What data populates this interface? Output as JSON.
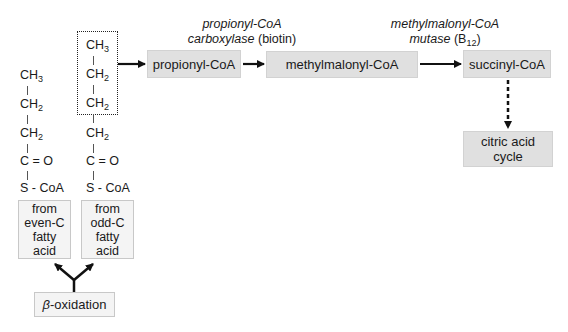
{
  "diagram": {
    "even_chain": {
      "atoms": [
        {
          "base": "CH",
          "sub": "3"
        },
        {
          "base": "CH",
          "sub": "2"
        },
        {
          "base": "CH",
          "sub": "2"
        },
        {
          "base": "C = O",
          "sub": ""
        },
        {
          "base": "S - CoA",
          "sub": ""
        }
      ],
      "source_label": [
        "from",
        "even-C",
        "fatty",
        "acid"
      ]
    },
    "odd_chain": {
      "atoms": [
        {
          "base": "CH",
          "sub": "3"
        },
        {
          "base": "CH",
          "sub": "2"
        },
        {
          "base": "CH",
          "sub": "2"
        },
        {
          "base": "CH",
          "sub": "2"
        },
        {
          "base": "C = O",
          "sub": ""
        },
        {
          "base": "S - CoA",
          "sub": ""
        }
      ],
      "source_label": [
        "from",
        "odd-C",
        "fatty",
        "acid"
      ]
    },
    "origin": {
      "greek": "β",
      "rest": "-oxidation"
    },
    "nodes": {
      "propionyl": "propionyl-CoA",
      "methylmalonyl": "methylmalonyl-CoA",
      "succinyl": "succinyl-CoA",
      "citric_line1": "citric acid",
      "citric_line2": "cycle"
    },
    "enzymes": {
      "carboxylase": {
        "line1": "propionyl-CoA",
        "line2_italic": "carboxylase",
        "line2_plain": " (biotin)"
      },
      "mutase": {
        "line1": "methylmalonyl-CoA",
        "line2_italic": "mutase",
        "line2_plain_pre": " (B",
        "line2_sub": "12",
        "line2_plain_post": ")"
      }
    },
    "colors": {
      "node_fill": "#e0e0e0",
      "source_fill": "#f4f4f4",
      "arrow": "#111111"
    }
  }
}
